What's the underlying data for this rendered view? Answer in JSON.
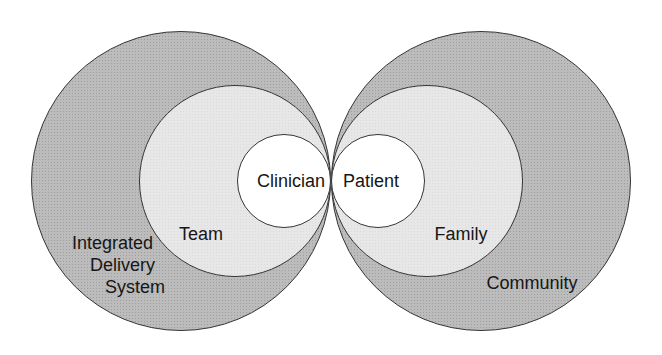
{
  "diagram": {
    "left": {
      "outer": {
        "label": "Integrated Delivery System",
        "lines": [
          "Integrated",
          "Delivery",
          "System"
        ]
      },
      "middle": {
        "label": "Team"
      },
      "inner": {
        "label": "Clinician"
      }
    },
    "right": {
      "outer": {
        "label": "Community"
      },
      "middle": {
        "label": "Family"
      },
      "inner": {
        "label": "Patient"
      }
    },
    "colors": {
      "outer_ring_fill": "#bcbcbc",
      "middle_ring_fill": "#e7e7e7",
      "inner_circle_fill": "#ffffff",
      "outline": "#353535",
      "text": "#161616",
      "background": "#ffffff"
    }
  }
}
